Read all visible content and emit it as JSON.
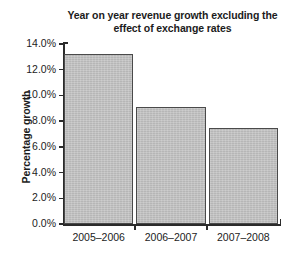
{
  "chart_data": {
    "type": "bar",
    "title": "Year on year revenue growth excluding the effect of exchange rates",
    "title_line1": "Year on year revenue growth excluding the",
    "title_line2": "effect of exchange rates",
    "xlabel": "",
    "ylabel": "Percentage growth",
    "categories": [
      "2005–2006",
      "2006–2007",
      "2007–2008"
    ],
    "values": [
      13.2,
      9.1,
      7.5
    ],
    "value_unit": "%",
    "ylim": [
      0.0,
      14.0
    ],
    "ytick_step": 2.0,
    "ytick_values": [
      0.0,
      2.0,
      4.0,
      6.0,
      8.0,
      10.0,
      12.0,
      14.0
    ],
    "ytick_labels": [
      "0.0%",
      "2.0%",
      "4.0%",
      "6.0%",
      "8.0%",
      "10.0%",
      "12.0%",
      "14.0%"
    ],
    "grid": false,
    "legend": false,
    "legend_position": "none",
    "series": [
      {
        "name": "Percentage growth",
        "values": [
          13.2,
          9.1,
          7.5
        ]
      }
    ],
    "colors": {
      "bar_fill": "#bdbdbd",
      "bar_border": "#4a4a4a",
      "axis": "#2b2b2b",
      "text": "#1c1c1c",
      "background": "#ffffff"
    }
  }
}
